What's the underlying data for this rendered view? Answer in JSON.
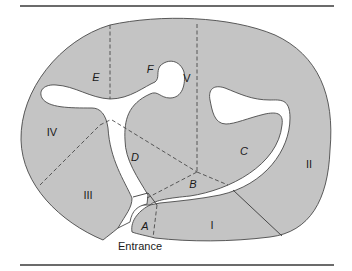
{
  "figure": {
    "type": "cave-region-map",
    "colors": {
      "region_fill": "#c4c4c4",
      "passage_fill": "#ffffff",
      "outline": "#4a4a4a",
      "rule": "#3a3a3a"
    },
    "roman_regions": [
      {
        "id": "I",
        "label": "I",
        "x": 212,
        "y": 229
      },
      {
        "id": "II",
        "label": "II",
        "x": 309,
        "y": 168
      },
      {
        "id": "III",
        "label": "III",
        "x": 88,
        "y": 199
      },
      {
        "id": "IV",
        "label": "IV",
        "x": 52,
        "y": 136
      },
      {
        "id": "V",
        "label": "V",
        "x": 187,
        "y": 82
      }
    ],
    "letter_regions": [
      {
        "id": "A",
        "label": "A",
        "x": 145,
        "y": 230
      },
      {
        "id": "B",
        "label": "B",
        "x": 193,
        "y": 188
      },
      {
        "id": "C",
        "label": "C",
        "x": 244,
        "y": 155
      },
      {
        "id": "D",
        "label": "D",
        "x": 135,
        "y": 161
      },
      {
        "id": "E",
        "label": "E",
        "x": 96,
        "y": 81
      },
      {
        "id": "F",
        "label": "F",
        "x": 150,
        "y": 73
      }
    ],
    "entrance_label": "Entrance"
  }
}
